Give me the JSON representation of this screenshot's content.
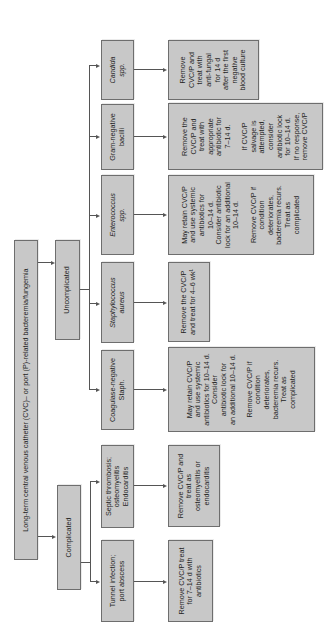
{
  "diagram": {
    "root": {
      "label": "Long-term central venous catheter (CVC)– or port (P)-related bacteremia/fungemia"
    },
    "branches": [
      {
        "label": "Complicated",
        "children": [
          {
            "condition": "Tunnel infection;\nport abscess",
            "action": "Remove CVC/P treat\nfor 7–14 d with\nantibiotics"
          },
          {
            "condition": "Septic thrombosis;\nosteomyelitis\nEndocarditis",
            "action": "Remove CVC/P and\ntreat as\nosteomyelitis or\nendocarditis"
          }
        ]
      },
      {
        "label": "Uncomplicated",
        "children": [
          {
            "condition": "Coagulase-negative\nStaph.",
            "action": "May retain CVC/P\nand use systemic\nantibiotics for 10–14 d.\nConsider\nantibiotic lock for\nan additional 10–14 d.\n\nRemove CVC/P if\ncondition\ndeteriorates,\nbacteremia recurs.\nTreat as\ncomplicated"
          },
          {
            "condition": "Staphylococcus\naureus",
            "italic": true,
            "action": "Remove the CVC/P\nand treat for 4–6 wk¹"
          },
          {
            "condition": "Enterococcus\nspp.",
            "italic": true,
            "action": "May retain CVC/P\nand use systemic\nantibiotics for\n10–14 d.\nConsider antibiotic\nlock for an additional\n10–14 d.\n\nRemove CVC/P if\ncondition\ndeteriorates,\nbacteremia recurs.\nTreat as\ncomplicated"
          },
          {
            "condition": "Gram-negative\nbacilli",
            "action": "Remove the\nCVC/P and\ntreat with\nappropriate\nantibiotic for\n7–14 d.\n\nIf CVC/P\nsalvage is\nattempted,\nconsider\nantibiotic lock\nfor 10–14 d.\nIf no response,\nremove CVC/P"
          },
          {
            "condition": "Candida\nspp.",
            "italic": true,
            "action": "Remove\nCVC/P and\ntreat with\nanti-fungal\nfor 14 d\nafter the first\nnegative\nblood culture"
          }
        ]
      }
    ]
  },
  "colors": {
    "box_fill": "#c8c8c8",
    "box_border": "#6e6e6e",
    "line": "#555555",
    "background": "#ffffff"
  }
}
